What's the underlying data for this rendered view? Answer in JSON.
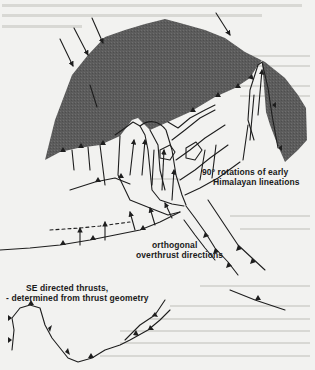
{
  "figure": {
    "type": "tectonic sketch map",
    "labels": {
      "rotations": "90° rotations of early",
      "rotations_2": "Himalayan lineations",
      "orthogonal": "orthogonal",
      "orthogonal_2": "overthrust directions",
      "se_thrusts": "SE directed thrusts,",
      "se_thrusts_2": "- determined from thrust geometry"
    },
    "colors": {
      "shaded_region": "#5a5a5a",
      "line": "#1e1e1e",
      "background": "#f2f2f0"
    }
  }
}
